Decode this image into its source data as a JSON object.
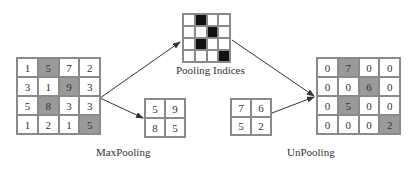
{
  "input_grid": {
    "values": [
      [
        1,
        5,
        7,
        2
      ],
      [
        3,
        1,
        9,
        3
      ],
      [
        5,
        8,
        3,
        3
      ],
      [
        1,
        2,
        1,
        5
      ]
    ],
    "highlight": [
      [
        0,
        1
      ],
      [
        1,
        2
      ],
      [
        2,
        1
      ],
      [
        3,
        3
      ]
    ]
  },
  "pooling_indices": {
    "label": "Pooling Indices",
    "mask": [
      [
        0,
        1,
        0,
        0
      ],
      [
        0,
        0,
        1,
        0
      ],
      [
        0,
        1,
        0,
        0
      ],
      [
        0,
        0,
        0,
        1
      ]
    ]
  },
  "maxpool_output": {
    "values": [
      [
        5,
        9
      ],
      [
        8,
        5
      ]
    ],
    "label": "MaxPooling"
  },
  "unpool_input": {
    "values": [
      [
        7,
        6
      ],
      [
        5,
        2
      ]
    ],
    "label": "UnPooling"
  },
  "unpool_output": {
    "values": [
      [
        0,
        7,
        0,
        0
      ],
      [
        0,
        0,
        6,
        0
      ],
      [
        0,
        5,
        0,
        0
      ],
      [
        0,
        0,
        0,
        2
      ]
    ],
    "highlight": [
      [
        0,
        1
      ],
      [
        1,
        2
      ],
      [
        2,
        1
      ],
      [
        3,
        3
      ]
    ]
  },
  "colors": {
    "highlight": "#9a9a9a",
    "index_black": "#111111",
    "border": "#8a8a8a"
  }
}
